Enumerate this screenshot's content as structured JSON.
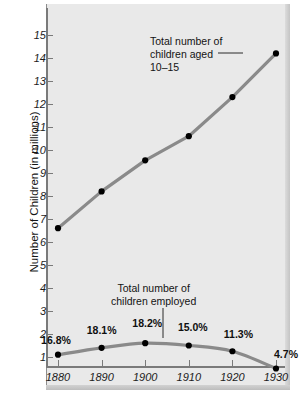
{
  "chart_data": {
    "type": "line",
    "title": "",
    "xlabel": "",
    "ylabel": "Number of Children (in millions)",
    "x": [
      1880,
      1890,
      1900,
      1910,
      1920,
      1930
    ],
    "xtick_labels": [
      "1880",
      "1890",
      "1900",
      "1910",
      "1920",
      "1930"
    ],
    "ytick_labels": [
      "1",
      "2",
      "3",
      "4",
      "5",
      "6",
      "7",
      "8",
      "9",
      "10",
      "11",
      "12",
      "13",
      "14",
      "15"
    ],
    "ylim": [
      0,
      15
    ],
    "xlim": [
      1875,
      1935
    ],
    "grid": false,
    "legend": "none",
    "series": [
      {
        "name": "Total number of children aged 10-15",
        "values": [
          6.6,
          8.2,
          9.55,
          10.6,
          12.3,
          14.2
        ],
        "color": "#8a8a8a",
        "marker_color": "#000000"
      },
      {
        "name": "Total number of children employed",
        "values": [
          1.1,
          1.4,
          1.6,
          1.5,
          1.25,
          0.5
        ],
        "color": "#8a8a8a",
        "marker_color": "#000000",
        "point_labels": [
          "16.8%",
          "18.1%",
          "18.2%",
          "15.0%",
          "11.3%",
          "4.7%"
        ]
      }
    ],
    "annotations": [
      {
        "id": "aged",
        "lines": [
          "Total number of",
          "children aged",
          "10–15"
        ]
      },
      {
        "id": "employed",
        "lines": [
          "Total number of",
          "children employed"
        ]
      }
    ]
  },
  "colors": {
    "panel_background": "#e9e9e9",
    "page_background": "#ffffff",
    "line": "#8a8a8a",
    "marker": "#000000",
    "axis": "#7a7a7a",
    "shadow": "#b9b9b9",
    "text": "#141414"
  }
}
